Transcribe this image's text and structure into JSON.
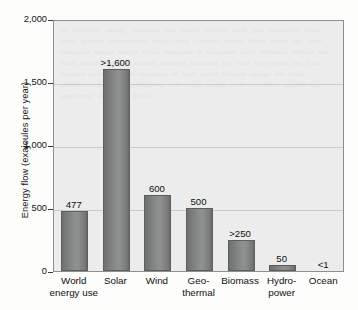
{
  "chart_data": {
    "type": "bar",
    "title": "",
    "xlabel": "",
    "ylabel": "Energy flow (exajoules per year)",
    "ylim": [
      0,
      2000
    ],
    "yticks": [
      0,
      500,
      1000,
      1500,
      2000
    ],
    "ytick_labels": [
      "0",
      "500",
      "1,000",
      "1,500",
      "2,000"
    ],
    "grid": "horizontal",
    "legend": "none",
    "categories": [
      "World\nenergy use",
      "Solar",
      "Wind",
      "Geo-\nthermal",
      "Biomass",
      "Hydro-\npower",
      "Ocean"
    ],
    "values": [
      477,
      1600,
      600,
      500,
      250,
      50,
      1
    ],
    "data_labels": [
      "477",
      ">1,600",
      "600",
      "500",
      ">250",
      "50",
      "<1"
    ],
    "colors": {
      "bar_fill_dark": "#6f7170",
      "bar_fill_light": "#8f9190",
      "bar_edge": "#5d5f5e",
      "plot_background": "#ebeceb",
      "plot_border": "#8d8f8e",
      "gridline": "#c9cac9",
      "page_background": "#fdfdfc",
      "text": "#101010"
    }
  },
  "axis": {
    "y_title": "Energy flow (exajoules per year)"
  },
  "artifacts": {
    "showthrough_text": "the available energy resources that nature provides each year renewable flows dwarf present consumption while fossil reserves remain finite stocks the chart compares annual energy flows measured in exajoules solar radiation striking the earth surface exceeds sixteen hundred exajoules per year far beyond the four hundred seventy seven exajoules of total world primary energy use wind geothermal biomass hydropower and ocean energy each contribute smaller but significant renewable flows"
  }
}
